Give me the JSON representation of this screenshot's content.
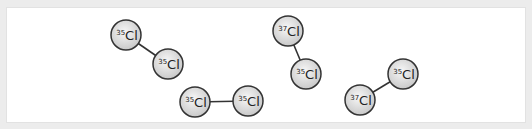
{
  "diagram": {
    "title": "",
    "colors": {
      "background": "#ececec",
      "panel": "#ffffff",
      "atom_outline": "#333333",
      "atom_fill_center": "#f7f7f7",
      "atom_fill_edge": "#c9c9c9",
      "bond": "#333333"
    },
    "atom_radius": 15,
    "element": "Cl",
    "molecules": [
      {
        "id": "m1",
        "atoms": [
          {
            "mass": "35",
            "element": "Cl",
            "x": 126,
            "y": 35
          },
          {
            "mass": "35",
            "element": "Cl",
            "x": 168,
            "y": 64
          }
        ]
      },
      {
        "id": "m2",
        "atoms": [
          {
            "mass": "35",
            "element": "Cl",
            "x": 195,
            "y": 102
          },
          {
            "mass": "35",
            "element": "Cl",
            "x": 248,
            "y": 101
          }
        ]
      },
      {
        "id": "m3",
        "atoms": [
          {
            "mass": "37",
            "element": "Cl",
            "x": 288,
            "y": 31
          },
          {
            "mass": "35",
            "element": "Cl",
            "x": 306,
            "y": 74
          }
        ]
      },
      {
        "id": "m4",
        "atoms": [
          {
            "mass": "37",
            "element": "Cl",
            "x": 360,
            "y": 100
          },
          {
            "mass": "35",
            "element": "Cl",
            "x": 403,
            "y": 74
          }
        ]
      }
    ]
  }
}
